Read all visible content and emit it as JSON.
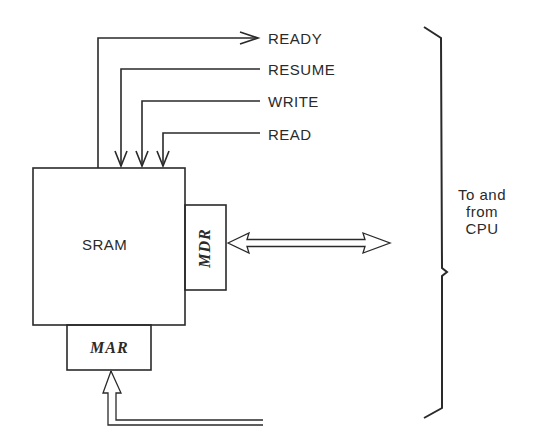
{
  "diagram": {
    "blocks": {
      "sram": "SRAM",
      "mdr": "MDR",
      "mar": "MAR"
    },
    "signals": [
      {
        "label": "READY",
        "direction": "out"
      },
      {
        "label": "RESUME",
        "direction": "in"
      },
      {
        "label": "WRITE",
        "direction": "in"
      },
      {
        "label": "READ",
        "direction": "in"
      }
    ],
    "brace_label": [
      "To and",
      "from",
      "CPU"
    ],
    "connections": [
      {
        "from": "SRAM",
        "to": "READY",
        "type": "single-arrow"
      },
      {
        "from": "RESUME",
        "to": "SRAM",
        "type": "single-arrow"
      },
      {
        "from": "WRITE",
        "to": "SRAM",
        "type": "single-arrow"
      },
      {
        "from": "READ",
        "to": "SRAM",
        "type": "single-arrow"
      },
      {
        "from": "MDR",
        "to": "CPU",
        "type": "bidirectional-bus"
      },
      {
        "from": "CPU",
        "to": "MAR",
        "type": "bus"
      }
    ]
  }
}
